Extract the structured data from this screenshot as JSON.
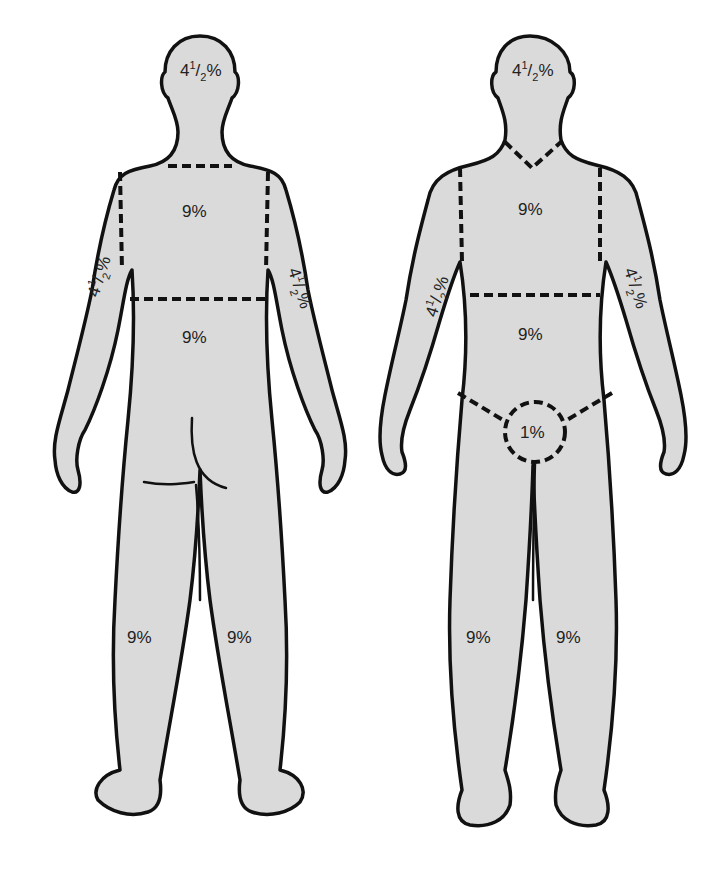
{
  "diagram": {
    "type": "rule-of-nines-body-surface-area",
    "figures": [
      {
        "view": "back",
        "regions": {
          "head": {
            "whole": "4",
            "frac_num": "1",
            "frac_den": "2",
            "suffix": "%"
          },
          "upper_back": "9%",
          "lower_back": "9%",
          "left_arm": {
            "whole": "4",
            "frac_num": "1",
            "frac_den": "2",
            "suffix": "%"
          },
          "right_arm": {
            "whole": "4",
            "frac_num": "1",
            "frac_den": "2",
            "suffix": "%"
          },
          "left_leg": "9%",
          "right_leg": "9%"
        }
      },
      {
        "view": "front",
        "regions": {
          "head": {
            "whole": "4",
            "frac_num": "1",
            "frac_den": "2",
            "suffix": "%"
          },
          "chest": "9%",
          "abdomen": "9%",
          "left_arm": {
            "whole": "4",
            "frac_num": "1",
            "frac_den": "2",
            "suffix": "%"
          },
          "right_arm": {
            "whole": "4",
            "frac_num": "1",
            "frac_den": "2",
            "suffix": "%"
          },
          "genitals": "1%",
          "left_leg": "9%",
          "right_leg": "9%"
        }
      }
    ],
    "colors": {
      "fill": "#dadada",
      "outline": "#111111",
      "background": "#ffffff"
    }
  }
}
